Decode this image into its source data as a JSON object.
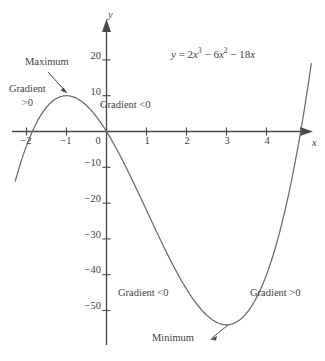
{
  "chart_data": {
    "type": "line",
    "title": "",
    "equation_plain": "y = 2x^3 - 6x^2 - 18x",
    "equation_parts": {
      "lhs": "y",
      "eq": "=",
      "t1_coef": "2",
      "t1_var": "x",
      "t1_exp": "3",
      "op1": "−",
      "t2_coef": "6",
      "t2_var": "x",
      "t2_exp": "2",
      "op2": "−",
      "t3_coef": "18",
      "t3_var": "x"
    },
    "xlabel": "x",
    "ylabel": "y",
    "xlim": [
      -2.3,
      5.2
    ],
    "ylim": [
      -58,
      26
    ],
    "xticks": [
      -2,
      -1,
      0,
      1,
      2,
      3,
      4
    ],
    "xtick_labels": [
      "−2",
      "−1",
      "0",
      "1",
      "2",
      "3",
      "4"
    ],
    "yticks": [
      20,
      10,
      -10,
      -20,
      -30,
      -40,
      -50
    ],
    "ytick_labels": [
      "20",
      "10",
      "−10",
      "−20",
      "−30",
      "−40",
      "−50"
    ],
    "grid": false,
    "legend": "none",
    "curve_color": "#6a6a6a",
    "axis_color": "#4a4a4a",
    "text_color": "#3f3f3f",
    "roots": [
      -1.854,
      0,
      4.854
    ],
    "critical_points": [
      {
        "name": "Maximum",
        "x": -1,
        "y": 10
      },
      {
        "name": "Minimum",
        "x": 3,
        "y": -54
      }
    ],
    "points": [
      {
        "x": -2.0,
        "y": -4
      },
      {
        "x": -1.9,
        "y": -1.8
      },
      {
        "x": -1.8,
        "y": 0.3
      },
      {
        "x": -1.7,
        "y": 2.3
      },
      {
        "x": -1.6,
        "y": 4.2
      },
      {
        "x": -1.5,
        "y": 6.0
      },
      {
        "x": -1.4,
        "y": 7.5
      },
      {
        "x": -1.3,
        "y": 8.8
      },
      {
        "x": -1.2,
        "y": 9.6
      },
      {
        "x": -1.1,
        "y": 9.9
      },
      {
        "x": -1.0,
        "y": 10.0
      },
      {
        "x": -0.9,
        "y": 9.6
      },
      {
        "x": -0.8,
        "y": 8.9
      },
      {
        "x": -0.6,
        "y": 6.8
      },
      {
        "x": -0.4,
        "y": 4.0
      },
      {
        "x": -0.2,
        "y": 1.3
      },
      {
        "x": 0.0,
        "y": 0.0
      },
      {
        "x": 0.2,
        "y": -3.8
      },
      {
        "x": 0.5,
        "y": -10.3
      },
      {
        "x": 1.0,
        "y": -22.0
      },
      {
        "x": 1.5,
        "y": -33.8
      },
      {
        "x": 2.0,
        "y": -44.0
      },
      {
        "x": 2.5,
        "y": -51.3
      },
      {
        "x": 3.0,
        "y": -54.0
      },
      {
        "x": 3.5,
        "y": -51.3
      },
      {
        "x": 4.0,
        "y": -40.0
      },
      {
        "x": 4.4,
        "y": -26.2
      },
      {
        "x": 4.7,
        "y": -12.1
      },
      {
        "x": 4.95,
        "y": 1.7
      },
      {
        "x": 5.05,
        "y": 8.0
      }
    ]
  },
  "annotations": {
    "maximum_label": "Maximum",
    "minimum_label": "Minimum",
    "gradient_pos_left_line1": "Gradient",
    "gradient_pos_left_line2": ">0",
    "gradient_neg_top": "Gradient  <0",
    "gradient_neg_bottom": "Gradient  <0",
    "gradient_pos_right": "Gradient  >0"
  }
}
